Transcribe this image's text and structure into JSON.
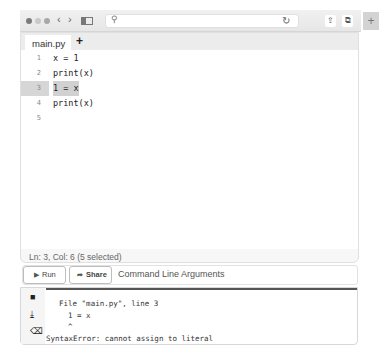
{
  "browser": {
    "traffic_lights": [
      "close",
      "minimize",
      "zoom"
    ],
    "back_icon": "‹",
    "forward_icon": "›",
    "search_icon": "🔍",
    "url": "",
    "reload_icon": "↻",
    "share_icon": "⇪",
    "tabs_icon": "⧉",
    "new_tab_icon": "+"
  },
  "editor": {
    "tabs": [
      {
        "label": "main.py",
        "active": true
      }
    ],
    "add_tab_label": "+",
    "lines": [
      {
        "number": "1",
        "text": "x = 1"
      },
      {
        "number": "2",
        "text": "print(x)"
      },
      {
        "number": "3",
        "text": "1 = x",
        "active": true
      },
      {
        "number": "4",
        "text": "print(x)"
      },
      {
        "number": "5",
        "text": ""
      }
    ],
    "status": "Ln: 3,  Col: 6 (5 selected)"
  },
  "actions": {
    "run_icon": "▶",
    "run_label": "Run",
    "share_icon": "➦",
    "share_label": "Share",
    "cli_placeholder": "Command Line Arguments"
  },
  "output": {
    "icons": [
      "stop-icon",
      "download-icon",
      "clear-icon"
    ],
    "icon_glyphs": [
      "■",
      "⤓",
      "⌫"
    ],
    "lines": [
      "  File \"main.py\", line 3",
      "    1 = x",
      "    ^",
      "SyntaxError: cannot assign to literal"
    ]
  }
}
